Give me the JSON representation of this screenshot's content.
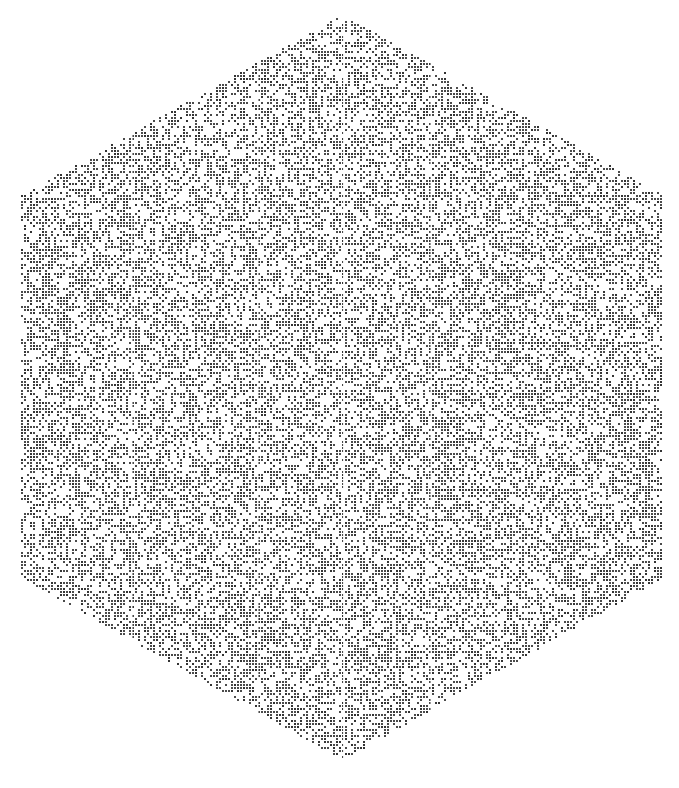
{
  "figure": {
    "shape": "hexagon",
    "fill": "dithered-noise",
    "vertices": [
      [
        343,
        15
      ],
      [
        663,
        195
      ],
      [
        663,
        578
      ],
      [
        343,
        760
      ],
      [
        22,
        578
      ],
      [
        22,
        195
      ]
    ],
    "colors": {
      "background": "#ffffff",
      "dot": "#4a4a4a",
      "dot_dark": "#333333"
    },
    "density": 0.5,
    "seam_x": [
      343,
      132,
      258,
      430,
      560
    ],
    "seam_color": "#ffffff"
  }
}
